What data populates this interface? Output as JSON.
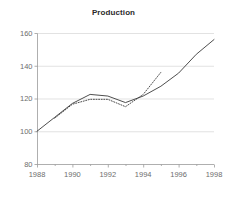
{
  "chart_data": {
    "type": "line",
    "title": "Production",
    "xlabel": "",
    "ylabel": "",
    "xlim": [
      1988,
      1998
    ],
    "ylim": [
      80,
      160
    ],
    "grid": true,
    "legend": "none",
    "xticks": [
      1988,
      1990,
      1992,
      1994,
      1996,
      1998
    ],
    "yticks": [
      80,
      100,
      120,
      140,
      160
    ],
    "xtick_labels": [
      "1988",
      "1990",
      "1992",
      "1994",
      "1996",
      "1998"
    ],
    "ytick_labels": [
      "80",
      "100",
      "120",
      "140",
      "160"
    ],
    "x": [
      1988,
      1989,
      1990,
      1991,
      1992,
      1993,
      1994,
      1995,
      1996,
      1997,
      1998
    ],
    "series": [
      {
        "name": "actual",
        "style": "solid",
        "color": "#3a3a3a",
        "x": [
          1988,
          1989,
          1990,
          1991,
          1992,
          1993,
          1994,
          1995,
          1996,
          1997,
          1998
        ],
        "values": [
          100,
          108.5,
          117,
          122.5,
          121.5,
          117.5,
          121.5,
          127.5,
          135.5,
          147,
          156
        ]
      },
      {
        "name": "forecast",
        "style": "dotted",
        "color": "#3a3a3a",
        "x": [
          1989,
          1990,
          1991,
          1992,
          1993,
          1994,
          1995
        ],
        "values": [
          108,
          116.5,
          119.5,
          119.5,
          115,
          122.5,
          136
        ]
      }
    ]
  },
  "plot_geometry": {
    "left": 37,
    "right": 214,
    "top": 33,
    "bottom": 164
  }
}
